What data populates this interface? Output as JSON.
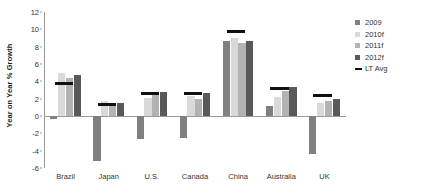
{
  "chart_data": {
    "type": "bar",
    "title": "",
    "xlabel": "",
    "ylabel": "Year on Year % Growth",
    "categories": [
      "Brazil",
      "Japan",
      "U.S.",
      "Canada",
      "China",
      "Australia",
      "UK"
    ],
    "series": [
      {
        "name": "2009",
        "color": "#808080",
        "values": [
          -0.3,
          -5.2,
          -2.6,
          -2.5,
          8.7,
          1.2,
          -4.4
        ]
      },
      {
        "name": "2010f",
        "color": "#d9d9d9",
        "values": [
          5.0,
          1.7,
          2.1,
          2.3,
          9.0,
          2.2,
          1.5
        ]
      },
      {
        "name": "2011f",
        "color": "#b3b3b3",
        "values": [
          4.4,
          1.5,
          2.4,
          2.0,
          8.4,
          2.9,
          1.7
        ]
      },
      {
        "name": "2012f",
        "color": "#595959",
        "values": [
          4.7,
          1.5,
          2.8,
          2.7,
          8.6,
          3.3,
          2.0
        ]
      }
    ],
    "lt_avg": {
      "name": "LT Avg",
      "color": "#111111",
      "values": [
        3.8,
        1.3,
        2.6,
        2.6,
        9.7,
        3.2,
        2.4
      ]
    },
    "yticks": [
      12,
      10,
      8,
      6,
      4,
      2,
      0,
      -2,
      -4,
      -6
    ],
    "ylim": [
      -6,
      12
    ],
    "grid": false,
    "legend_position": "right",
    "legend_entries": [
      "2009",
      "2010f",
      "2011f",
      "2012f",
      "LT Avg"
    ]
  }
}
